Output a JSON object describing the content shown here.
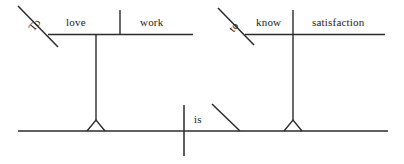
{
  "diagram": {
    "type": "reed-kellogg-sentence-diagram",
    "sentence": "To love work is to know satisfaction",
    "stroke_color": "#2b2b2b",
    "background_color": "#ffffff",
    "text_color": "#1b1b1b",
    "labels": {
      "to_left": "To",
      "subject_verb": "love",
      "subject_object": "work",
      "to_right": "to",
      "predicate_verb": "know",
      "predicate_object": "satisfaction",
      "main_verb": "is"
    },
    "units": [
      {
        "name": "subject-infinitive-phrase",
        "preposition": "To",
        "verb": "love",
        "object": "work"
      },
      {
        "name": "predicate-infinitive-phrase",
        "preposition": "to",
        "verb": "know",
        "object": "satisfaction"
      }
    ],
    "main_clause": {
      "verb": "is"
    }
  }
}
